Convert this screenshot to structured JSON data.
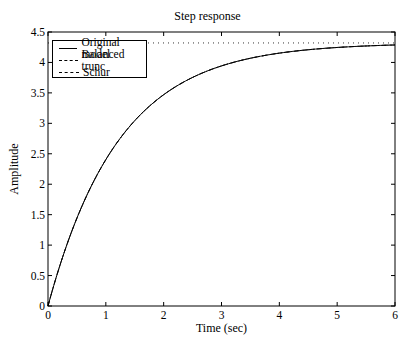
{
  "chart_data": {
    "type": "line",
    "title": "Step response",
    "xlabel": "Time (sec)",
    "ylabel": "Amplitude",
    "xlim": [
      0,
      6
    ],
    "ylim": [
      0,
      4.5
    ],
    "xticks": [
      "0",
      "1",
      "2",
      "3",
      "4",
      "5",
      "6"
    ],
    "yticks": [
      "0",
      "0.5",
      "1",
      "1.5",
      "2",
      "2.5",
      "3",
      "3.5",
      "4",
      "4.5"
    ],
    "grid": false,
    "legend_position": "upper left",
    "steady_state_value": 4.32,
    "series": [
      {
        "name": "Original model",
        "style": "solid",
        "x": [
          0,
          0.5,
          1,
          1.5,
          2,
          2.5,
          3,
          3.5,
          4,
          4.5,
          5,
          5.5,
          6
        ],
        "values": [
          0,
          1.43,
          2.4,
          3.04,
          3.47,
          3.76,
          3.95,
          4.08,
          4.17,
          4.22,
          4.26,
          4.28,
          4.3
        ]
      },
      {
        "name": "Balanced trunc",
        "style": "dashdot",
        "x": [
          0,
          0.5,
          1,
          1.5,
          2,
          2.5,
          3,
          3.5,
          4,
          4.5,
          5,
          5.5,
          6
        ],
        "values": [
          0,
          1.43,
          2.4,
          3.04,
          3.47,
          3.76,
          3.95,
          4.08,
          4.17,
          4.22,
          4.26,
          4.28,
          4.3
        ]
      },
      {
        "name": "Schur",
        "style": "dashed",
        "x": [
          0,
          0.5,
          1,
          1.5,
          2,
          2.5,
          3,
          3.5,
          4,
          4.5,
          5,
          5.5,
          6
        ],
        "values": [
          0,
          1.43,
          2.4,
          3.04,
          3.47,
          3.76,
          3.95,
          4.08,
          4.17,
          4.22,
          4.26,
          4.28,
          4.3
        ]
      }
    ]
  },
  "labels": {
    "title": "Step response",
    "xlabel": "Time (sec)",
    "ylabel": "Amplitude",
    "legend": [
      "Original model",
      "Balanced trunc",
      "Schur"
    ]
  }
}
